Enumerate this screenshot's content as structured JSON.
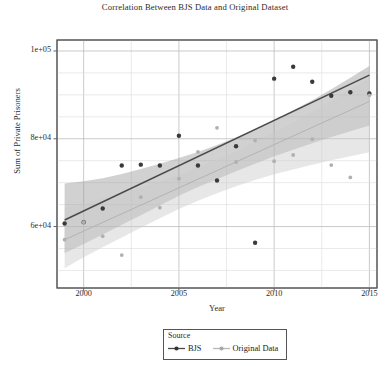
{
  "chart_data": {
    "type": "scatter",
    "title": "Correlation Between BJS Data and Original Dataset",
    "xlabel": "Year",
    "ylabel": "Sum of Private Prisoners",
    "xlim": [
      1998.6,
      2015.4
    ],
    "ylim": [
      46000,
      102500
    ],
    "xticks": [
      2000,
      2005,
      2010,
      2015
    ],
    "xtick_labels": [
      "2000",
      "2005",
      "2010",
      "2015"
    ],
    "yticks": [
      60000,
      80000,
      100000
    ],
    "ytick_labels": [
      "6e+04",
      "8e+04",
      "1e+05"
    ],
    "grid": true,
    "grid_x_minor_step": 2.5,
    "grid_y_minor_step": 5000,
    "legend": {
      "title": "Source",
      "position": "bottom-center-outside",
      "entries": [
        {
          "label": "BJS",
          "color": "#4a4a4a",
          "marker": "circle"
        },
        {
          "label": "Original Data",
          "color": "#b3b3b3",
          "marker": "circle"
        }
      ]
    },
    "series": [
      {
        "name": "BJS",
        "color": "#4a4a4a",
        "band_color": "#9a9a9a",
        "x": [
          1999,
          2000,
          2001,
          2002,
          2003,
          2004,
          2005,
          2006,
          2007,
          2008,
          2009,
          2010,
          2011,
          2012,
          2013,
          2014,
          2015
        ],
        "values": [
          60700,
          61000,
          64100,
          73900,
          74100,
          73900,
          80700,
          73900,
          70500,
          78300,
          56300,
          93700,
          96400,
          93000,
          89800,
          90600,
          90300
        ],
        "fit": {
          "intercept_1999": 61500,
          "value_2015": 94500
        },
        "ci_lower": [
          54000,
          56000,
          58200,
          60400,
          62600,
          64800,
          67000,
          69000,
          70800,
          72600,
          74300,
          76000,
          77500,
          79000,
          80400,
          81700,
          83000
        ],
        "ci_upper": [
          69800,
          70300,
          71000,
          72000,
          73100,
          74300,
          75600,
          77000,
          78600,
          80300,
          82200,
          84300,
          86500,
          88800,
          91300,
          93900,
          96600
        ]
      },
      {
        "name": "Original Data",
        "color": "#b3b3b3",
        "band_color": "#c9c9c9",
        "x": [
          1999,
          2000,
          2001,
          2002,
          2003,
          2004,
          2005,
          2006,
          2007,
          2008,
          2009,
          2010,
          2011,
          2012,
          2013,
          2014,
          2015
        ],
        "values": [
          57000,
          61000,
          57800,
          53500,
          66700,
          64300,
          70900,
          77000,
          82500,
          74700,
          79600,
          74900,
          76300,
          79900,
          74000,
          71200,
          89900
        ],
        "fit": {
          "intercept_1999": 57000,
          "value_2015": 88500
        },
        "ci_lower": [
          50500,
          53000,
          55300,
          57500,
          59700,
          61900,
          64000,
          65900,
          67600,
          69200,
          70600,
          71900,
          73000,
          74100,
          75100,
          76000,
          76900
        ],
        "ci_upper": [
          64200,
          65200,
          66300,
          67500,
          68800,
          70200,
          71700,
          73400,
          75200,
          77100,
          79200,
          81400,
          83700,
          86100,
          88600,
          91200,
          93800
        ]
      }
    ]
  },
  "figure": {
    "background": "#ffffff",
    "axis_color": "#444444",
    "grid_color": "#d8d8d8",
    "text_color": "#2b2b2b"
  }
}
